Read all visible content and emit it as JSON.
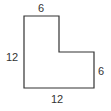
{
  "diagram": {
    "type": "L-shaped polygon with dimensions",
    "shape": {
      "stroke_color": "#333333",
      "fill_color": "#ffffff",
      "vertices": [
        [
          24,
          16
        ],
        [
          59,
          16
        ],
        [
          59,
          52
        ],
        [
          94,
          52
        ],
        [
          94,
          88
        ],
        [
          24,
          88
        ]
      ]
    },
    "labels": {
      "top": "6",
      "left": "12",
      "right": "6",
      "bottom": "12"
    }
  }
}
